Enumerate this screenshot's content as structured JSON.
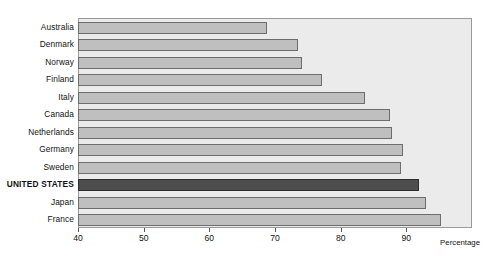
{
  "chart_data": {
    "type": "bar",
    "orientation": "horizontal",
    "title": "",
    "xlabel": "Percentage",
    "ylabel": "",
    "xlim": [
      40,
      100
    ],
    "xticks": [
      40,
      50,
      60,
      70,
      80,
      90
    ],
    "grid": false,
    "legend": null,
    "highlight_category": "UNITED STATES",
    "categories": [
      "Australia",
      "Denmark",
      "Norway",
      "Finland",
      "Italy",
      "Canada",
      "Netherlands",
      "Germany",
      "Sweden",
      "UNITED STATES",
      "Japan",
      "France"
    ],
    "values": [
      68.6,
      73.4,
      73.9,
      77.0,
      83.5,
      87.3,
      87.7,
      89.3,
      89.1,
      91.8,
      92.9,
      95.2
    ],
    "bars": [
      {
        "label": "Australia",
        "value": 68.6,
        "highlight": false
      },
      {
        "label": "Denmark",
        "value": 73.4,
        "highlight": false
      },
      {
        "label": "Norway",
        "value": 73.9,
        "highlight": false
      },
      {
        "label": "Finland",
        "value": 77.0,
        "highlight": false
      },
      {
        "label": "Italy",
        "value": 83.5,
        "highlight": false
      },
      {
        "label": "Canada",
        "value": 87.3,
        "highlight": false
      },
      {
        "label": "Netherlands",
        "value": 87.7,
        "highlight": false
      },
      {
        "label": "Germany",
        "value": 89.3,
        "highlight": false
      },
      {
        "label": "Sweden",
        "value": 89.1,
        "highlight": false
      },
      {
        "label": "UNITED STATES",
        "value": 91.8,
        "highlight": true
      },
      {
        "label": "Japan",
        "value": 92.9,
        "highlight": false
      },
      {
        "label": "France",
        "value": 95.2,
        "highlight": false
      }
    ],
    "tick_labels": [
      "40",
      "50",
      "60",
      "70",
      "80",
      "90"
    ],
    "colors": {
      "bar_fill": "#bfbfbf",
      "bar_stroke": "#6d6d6d",
      "highlight_fill": "#4d4d4d",
      "highlight_stroke": "#2e2e2e",
      "plot_background": "#ebebeb",
      "plot_border": "#9a9a9a",
      "page_background": "#ffffff",
      "text": "#111111"
    }
  }
}
